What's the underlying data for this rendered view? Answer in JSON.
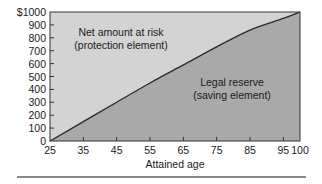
{
  "chart_data": {
    "type": "area",
    "title": "",
    "xlabel": "Attained age",
    "ylabel": "",
    "x": [
      25,
      35,
      45,
      55,
      65,
      75,
      85,
      95,
      100
    ],
    "series": [
      {
        "name": "Legal reserve (saving element)",
        "values": [
          0,
          150,
          300,
          450,
          590,
          730,
          860,
          950,
          1000
        ],
        "fill": "#a9a9a9"
      },
      {
        "name": "Net amount at risk (protection element)",
        "values": [
          1000,
          850,
          700,
          550,
          410,
          270,
          140,
          50,
          0
        ],
        "fill": "#d3d3d3"
      }
    ],
    "face_amount": 1000,
    "xlim": [
      25,
      100
    ],
    "ylim": [
      0,
      1000
    ],
    "x_ticks": [
      "25",
      "35",
      "45",
      "55",
      "65",
      "75",
      "85",
      "95",
      "100"
    ],
    "y_ticks": [
      "0",
      "100",
      "200",
      "300",
      "400",
      "500",
      "600",
      "700",
      "800",
      "900",
      "$1000"
    ],
    "annotations": {
      "upper_line1": "Net amount at risk",
      "upper_line2": "(protection element)",
      "lower_line1": "Legal reserve",
      "lower_line2": "(saving element)"
    },
    "grid": false,
    "legend": "none (inline region labels)",
    "colors": {
      "upper_region": "#d3d3d3",
      "lower_region": "#a9a9a9",
      "curve": "#2a2a2a",
      "axis": "#333333"
    }
  }
}
